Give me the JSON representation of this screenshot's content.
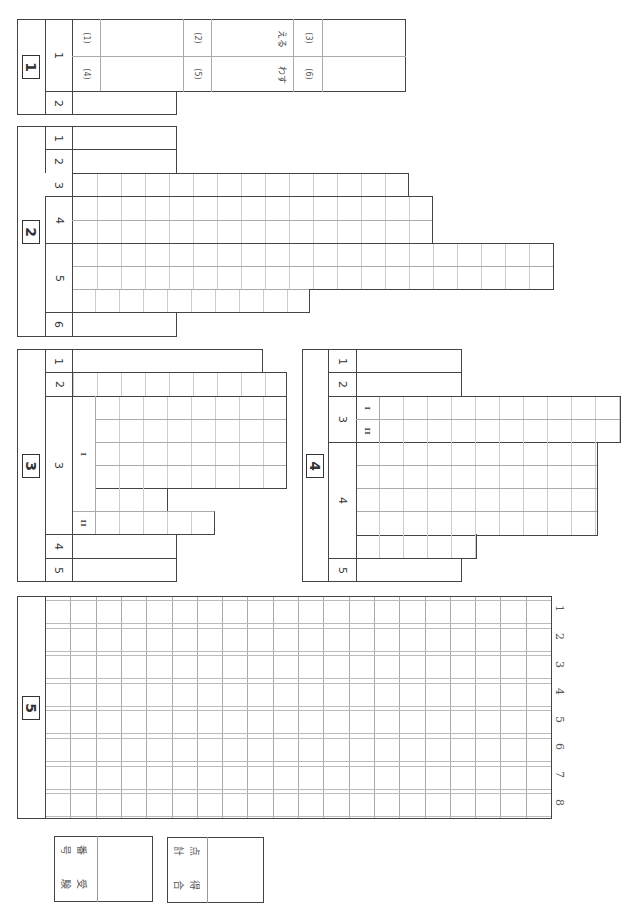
{
  "sheet": {
    "sections": [
      {
        "id": "1",
        "label": "1",
        "questions": [
          {
            "num": "1",
            "subitems": [
              "(1)",
              "(2)",
              "(3)",
              "(4)",
              "(5)",
              "(6)"
            ],
            "okurigana": [
              "える",
              "わす"
            ]
          },
          {
            "num": "2"
          }
        ]
      },
      {
        "id": "2",
        "label": "2",
        "questions": [
          {
            "num": "1"
          },
          {
            "num": "2"
          },
          {
            "num": "3"
          },
          {
            "num": "4"
          },
          {
            "num": "5"
          },
          {
            "num": "6"
          }
        ]
      },
      {
        "id": "3",
        "label": "3",
        "questions": [
          {
            "num": "1"
          },
          {
            "num": "2"
          },
          {
            "num": "3",
            "parts": [
              "I",
              "II"
            ]
          },
          {
            "num": "4"
          },
          {
            "num": "5"
          }
        ]
      },
      {
        "id": "4",
        "label": "4",
        "questions": [
          {
            "num": "1"
          },
          {
            "num": "2"
          },
          {
            "num": "3",
            "parts": [
              "I",
              "II"
            ]
          },
          {
            "num": "4"
          },
          {
            "num": "5"
          }
        ]
      },
      {
        "id": "5",
        "label": "5",
        "line_numbers": [
          "1",
          "2",
          "3",
          "4",
          "5",
          "6",
          "7",
          "8"
        ]
      }
    ],
    "footer": {
      "exam_number_label": [
        "受",
        "験",
        "番",
        "号"
      ],
      "total_score_label": [
        "合",
        "計",
        "得",
        "点"
      ]
    }
  }
}
